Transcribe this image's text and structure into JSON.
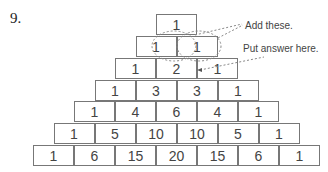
{
  "question_number": "9.",
  "pyramid": {
    "rows": [
      [
        "1"
      ],
      [
        "1",
        "1"
      ],
      [
        "1",
        "2",
        "1"
      ],
      [
        "1",
        "3",
        "3",
        "1"
      ],
      [
        "1",
        "4",
        "6",
        "4",
        "1"
      ],
      [
        "1",
        "5",
        "10",
        "10",
        "5",
        "1"
      ],
      [
        "1",
        "6",
        "15",
        "20",
        "15",
        "6",
        "1"
      ]
    ]
  },
  "annotations": {
    "add_these": "Add these.",
    "put_answer_here": "Put answer here."
  }
}
